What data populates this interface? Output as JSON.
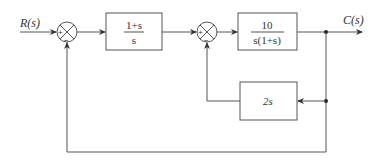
{
  "diagram": {
    "type": "control-system block diagram",
    "input_label": "R(s)",
    "output_label": "C(s)",
    "summing_junctions": [
      {
        "id": "sum1",
        "signs": {
          "left": "+",
          "bottom": "−"
        }
      },
      {
        "id": "sum2",
        "signs": {
          "left": "+",
          "bottom": "−"
        }
      }
    ],
    "blocks": [
      {
        "id": "G1",
        "numerator": "1+s",
        "denominator": "s"
      },
      {
        "id": "G2",
        "numerator": "10",
        "denominator": "s(1+s)"
      },
      {
        "id": "H",
        "text": "2s"
      }
    ],
    "colors": {
      "line": "#555555",
      "text": "#333333",
      "background": "#ffffff"
    }
  }
}
